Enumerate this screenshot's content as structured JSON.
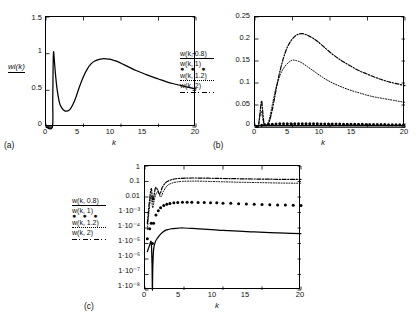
{
  "figure": {
    "panels": [
      {
        "id": "(a)"
      },
      {
        "id": "(b)"
      },
      {
        "id": "(c)"
      }
    ]
  },
  "legend": {
    "entries": [
      {
        "label": "w(k, 0.8)",
        "style": "solid"
      },
      {
        "label": "w(k, 1)",
        "style": "dots"
      },
      {
        "label": "w(k, 1.2)",
        "style": "dotted"
      },
      {
        "label": "w(k, 2)",
        "style": "dashdot"
      }
    ],
    "dots_glyph": "● ● ●"
  },
  "chart_data": [
    {
      "type": "line",
      "panel": "(a)",
      "title": "",
      "xlabel": "k",
      "ylabel": "wi(k)",
      "xlim": [
        0,
        20
      ],
      "ylim": [
        0,
        1.5
      ],
      "xticks": [
        0,
        5,
        10,
        15,
        20
      ],
      "xticklabels": [
        "0",
        "5",
        "10",
        "15",
        "20"
      ],
      "yticks": [
        0,
        0.5,
        1,
        1.5
      ],
      "yticklabels": [
        "0",
        "0.5",
        "1",
        "1.5"
      ],
      "grid": false,
      "legend_position": "right-outside",
      "series": [
        {
          "name": "wi(k)",
          "style": "solid",
          "x": [
            0.0,
            0.85,
            0.9,
            0.95,
            1.0,
            1.05,
            1.15,
            1.3,
            1.5,
            1.8,
            2.1,
            2.5,
            2.9,
            3.2,
            3.6,
            4.0,
            4.5,
            5.0,
            5.5,
            6.0,
            6.5,
            7.0,
            7.5,
            8.0,
            8.5,
            9.0,
            9.5,
            10.0,
            11.0,
            12.0,
            13.0,
            14.0,
            15.0,
            16.0,
            17.0,
            18.0,
            19.0,
            20.0
          ],
          "y": [
            0.0,
            0.0,
            0.35,
            0.85,
            1.02,
            0.99,
            0.86,
            0.68,
            0.5,
            0.33,
            0.26,
            0.22,
            0.22,
            0.24,
            0.31,
            0.41,
            0.56,
            0.69,
            0.79,
            0.86,
            0.9,
            0.92,
            0.93,
            0.93,
            0.925,
            0.91,
            0.895,
            0.87,
            0.82,
            0.77,
            0.73,
            0.69,
            0.655,
            0.62,
            0.59,
            0.565,
            0.54,
            0.52
          ]
        }
      ]
    },
    {
      "type": "line",
      "panel": "(b)",
      "title": "",
      "xlabel": "k",
      "ylabel": "",
      "xlim": [
        0,
        20
      ],
      "ylim": [
        0,
        0.25
      ],
      "xticks": [
        0,
        5,
        10,
        15,
        20
      ],
      "xticklabels": [
        "0",
        "5",
        "10",
        "15",
        "20"
      ],
      "yticks": [
        0,
        0.05,
        0.1,
        0.15,
        0.2,
        0.25
      ],
      "yticklabels": [
        "0",
        "0.05",
        "0.1",
        "0.15",
        "0.2",
        "0.25"
      ],
      "grid": false,
      "legend_position": "left-outside",
      "series": [
        {
          "name": "w(k, 0.8)",
          "style": "solid",
          "x": [
            0,
            1,
            2,
            3,
            5,
            8,
            12,
            16,
            20
          ],
          "y": [
            0.0,
            0.0,
            0.0,
            0.0,
            0.0,
            0.0,
            0.0,
            0.0,
            0.0
          ]
        },
        {
          "name": "w(k, 1)",
          "style": "dots",
          "x": [
            0.3,
            0.9,
            1.3,
            1.8,
            2.3,
            2.8,
            3.3,
            3.8,
            4.3,
            4.8,
            5.3,
            5.8,
            6.3,
            6.8,
            7.3,
            7.8,
            8.3,
            8.8,
            9.3,
            9.8,
            10.3,
            10.8,
            11.3,
            11.8,
            12.3,
            12.8,
            13.3,
            13.8,
            14.3,
            14.8,
            15.3,
            15.8,
            16.3,
            16.8,
            17.3,
            17.8,
            18.3,
            18.8,
            19.3,
            19.8
          ],
          "y": [
            0.001,
            0.004,
            0.005,
            0.006,
            0.0065,
            0.007,
            0.0072,
            0.0074,
            0.0075,
            0.0076,
            0.0076,
            0.0076,
            0.0075,
            0.0075,
            0.0074,
            0.0073,
            0.0072,
            0.0071,
            0.007,
            0.0069,
            0.0068,
            0.0067,
            0.0066,
            0.0065,
            0.0064,
            0.0063,
            0.0062,
            0.0061,
            0.006,
            0.0059,
            0.0058,
            0.0057,
            0.0056,
            0.0055,
            0.0054,
            0.0053,
            0.0052,
            0.0051,
            0.005,
            0.005
          ]
        },
        {
          "name": "w(k, 1.2)",
          "style": "dotted",
          "x": [
            0.4,
            0.8,
            1.0,
            1.2,
            1.5,
            1.8,
            2.0,
            2.3,
            2.7,
            3.0,
            3.5,
            4.0,
            4.5,
            5.0,
            5.5,
            6.0,
            6.5,
            7.0,
            7.5,
            8.0,
            9.0,
            10.0,
            11.0,
            12.0,
            13.0,
            14.0,
            15.0,
            16.0,
            17.0,
            18.0,
            19.0,
            20.0
          ],
          "y": [
            0.002,
            0.035,
            0.022,
            0.006,
            0.004,
            0.012,
            0.025,
            0.05,
            0.082,
            0.1,
            0.124,
            0.138,
            0.147,
            0.152,
            0.151,
            0.148,
            0.143,
            0.137,
            0.131,
            0.125,
            0.113,
            0.103,
            0.095,
            0.088,
            0.082,
            0.077,
            0.072,
            0.068,
            0.065,
            0.062,
            0.059,
            0.056
          ]
        },
        {
          "name": "w(k, 2)",
          "style": "dashdot",
          "x": [
            0.5,
            0.85,
            1.0,
            1.2,
            1.5,
            1.8,
            2.1,
            2.5,
            2.9,
            3.3,
            3.8,
            4.3,
            4.8,
            5.3,
            5.8,
            6.3,
            6.8,
            7.3,
            7.8,
            8.3,
            9.0,
            10.0,
            11.0,
            12.0,
            13.0,
            14.0,
            15.0,
            16.0,
            17.0,
            18.0,
            19.0,
            20.0
          ],
          "y": [
            0.004,
            0.058,
            0.04,
            0.009,
            0.003,
            0.008,
            0.024,
            0.056,
            0.093,
            0.125,
            0.157,
            0.181,
            0.196,
            0.206,
            0.211,
            0.212,
            0.21,
            0.206,
            0.201,
            0.195,
            0.185,
            0.17,
            0.157,
            0.146,
            0.136,
            0.127,
            0.12,
            0.113,
            0.107,
            0.102,
            0.098,
            0.094
          ]
        }
      ]
    },
    {
      "type": "line",
      "panel": "(c)",
      "title": "",
      "xlabel": "k",
      "ylabel": "",
      "xlim": [
        0,
        20
      ],
      "ylim": [
        1e-08,
        1
      ],
      "yscale": "log",
      "xticks": [
        0,
        5,
        10,
        15,
        20
      ],
      "xticklabels": [
        "0",
        "5",
        "10",
        "15",
        "20"
      ],
      "yticks": [
        1,
        0.1,
        0.01,
        0.001,
        0.0001,
        1e-05,
        1e-06,
        1e-07,
        1e-08
      ],
      "yticklabels": [
        "1",
        "0.1",
        "0.01",
        "1·10⁻³",
        "1·10⁻⁴",
        "1·10⁻⁵",
        "1·10⁻⁶",
        "1·10⁻⁷",
        "1·10⁻⁸"
      ],
      "grid": false,
      "legend_position": "left-outside",
      "series": [
        {
          "name": "w(k, 0.8)",
          "style": "solid",
          "x": [
            0.3,
            0.6,
            0.8,
            0.9,
            0.95,
            1.0,
            1.1,
            1.3,
            1.6,
            2.0,
            2.5,
            3.0,
            3.5,
            4.0,
            4.5,
            5.0,
            6.0,
            7.0,
            8.0,
            9.0,
            10.0,
            12.0,
            14.0,
            16.0,
            18.0,
            20.0
          ],
          "y": [
            3e-06,
            8e-06,
            1.2e-05,
            5e-07,
            1e-08,
            3e-07,
            4e-06,
            1.2e-05,
            2.2e-05,
            4e-05,
            6.5e-05,
            8e-05,
            9e-05,
            9.6e-05,
            0.0001,
            0.0001,
            9.5e-05,
            8.8e-05,
            8.2e-05,
            7.6e-05,
            7e-05,
            6.2e-05,
            5.6e-05,
            5.1e-05,
            4.7e-05,
            4.4e-05
          ]
        },
        {
          "name": "w(k, 1)",
          "style": "dots",
          "x": [
            0.3,
            0.6,
            0.8,
            0.95,
            1.1,
            1.4,
            1.7,
            2.0,
            2.4,
            2.8,
            3.2,
            3.7,
            4.2,
            4.8,
            5.4,
            6.0,
            6.8,
            7.6,
            8.4,
            9.2,
            10.0,
            11.0,
            12.0,
            13.0,
            14.0,
            15.0,
            16.0,
            17.0,
            18.0,
            19.0,
            20.0
          ],
          "y": [
            2e-05,
            9e-05,
            0.0002,
            1e-05,
            0.0002,
            0.0007,
            0.0013,
            0.002,
            0.0028,
            0.0034,
            0.0038,
            0.0042,
            0.0044,
            0.0046,
            0.0046,
            0.0046,
            0.0045,
            0.0044,
            0.0043,
            0.0042,
            0.004,
            0.0039,
            0.0037,
            0.0036,
            0.0034,
            0.0033,
            0.0032,
            0.0031,
            0.003,
            0.0029,
            0.0028
          ]
        },
        {
          "name": "w(k, 1.2)",
          "style": "dotted",
          "x": [
            0.3,
            0.6,
            0.8,
            0.9,
            1.0,
            1.15,
            1.4,
            1.7,
            2.0,
            2.4,
            2.8,
            3.2,
            3.7,
            4.2,
            4.8,
            5.5,
            6.2,
            7.0,
            8.0,
            9.0,
            10.0,
            11.0,
            12.0,
            13.0,
            14.0,
            15.0,
            16.0,
            17.0,
            18.0,
            19.0,
            20.0
          ],
          "y": [
            8e-05,
            0.003,
            0.012,
            0.004,
            0.002,
            0.005,
            0.015,
            0.022,
            0.01,
            0.025,
            0.05,
            0.07,
            0.085,
            0.095,
            0.102,
            0.105,
            0.106,
            0.105,
            0.102,
            0.099,
            0.096,
            0.093,
            0.09,
            0.088,
            0.086,
            0.084,
            0.082,
            0.08,
            0.079,
            0.078,
            0.077
          ]
        },
        {
          "name": "w(k, 2)",
          "style": "dashdot",
          "x": [
            0.3,
            0.6,
            0.8,
            0.9,
            1.0,
            1.15,
            1.35,
            1.6,
            1.9,
            2.2,
            2.6,
            3.0,
            3.5,
            4.0,
            4.6,
            5.2,
            6.0,
            7.0,
            8.0,
            9.0,
            10.0,
            11.0,
            12.0,
            13.0,
            14.0,
            15.0,
            16.0,
            17.0,
            18.0,
            19.0,
            20.0
          ],
          "y": [
            0.0002,
            0.008,
            0.035,
            0.015,
            0.005,
            0.012,
            0.04,
            0.03,
            0.015,
            0.04,
            0.08,
            0.11,
            0.135,
            0.15,
            0.16,
            0.165,
            0.168,
            0.167,
            0.164,
            0.16,
            0.156,
            0.153,
            0.15,
            0.147,
            0.145,
            0.143,
            0.141,
            0.139,
            0.138,
            0.137,
            0.136
          ]
        }
      ]
    }
  ]
}
